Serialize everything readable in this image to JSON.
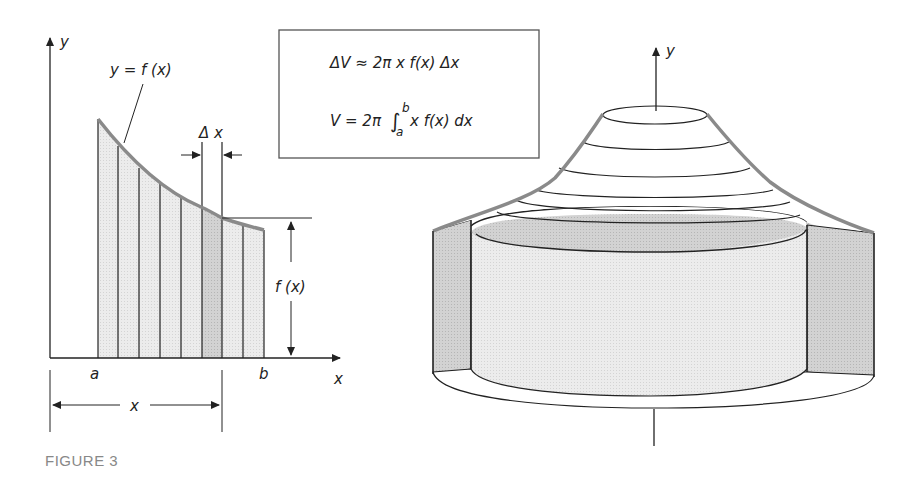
{
  "figure": {
    "caption": "FIGURE 3",
    "left_panel": {
      "y_axis_label": "y",
      "x_axis_label": "x",
      "curve_label": "y = f (x)",
      "delta_label": "Δ x",
      "a_label": "a",
      "b_label": "b",
      "height_label": "f (x)",
      "distance_label": "x"
    },
    "formula_box": {
      "line1": "ΔV ≈ 2π x  f(x)  Δx",
      "line2_prefix": "V = 2π ",
      "integral_sign": "∫",
      "upper_limit": "b",
      "lower_limit": "a",
      "line2_suffix": " x  f(x)  dx"
    },
    "right_panel": {
      "y_axis_label": "y"
    },
    "colors": {
      "ink": "#222222",
      "curve": "#8a8a8a",
      "light_fill": "#e6e6e6",
      "shell_fill": "#cfcfcf",
      "caption": "#888888"
    }
  }
}
